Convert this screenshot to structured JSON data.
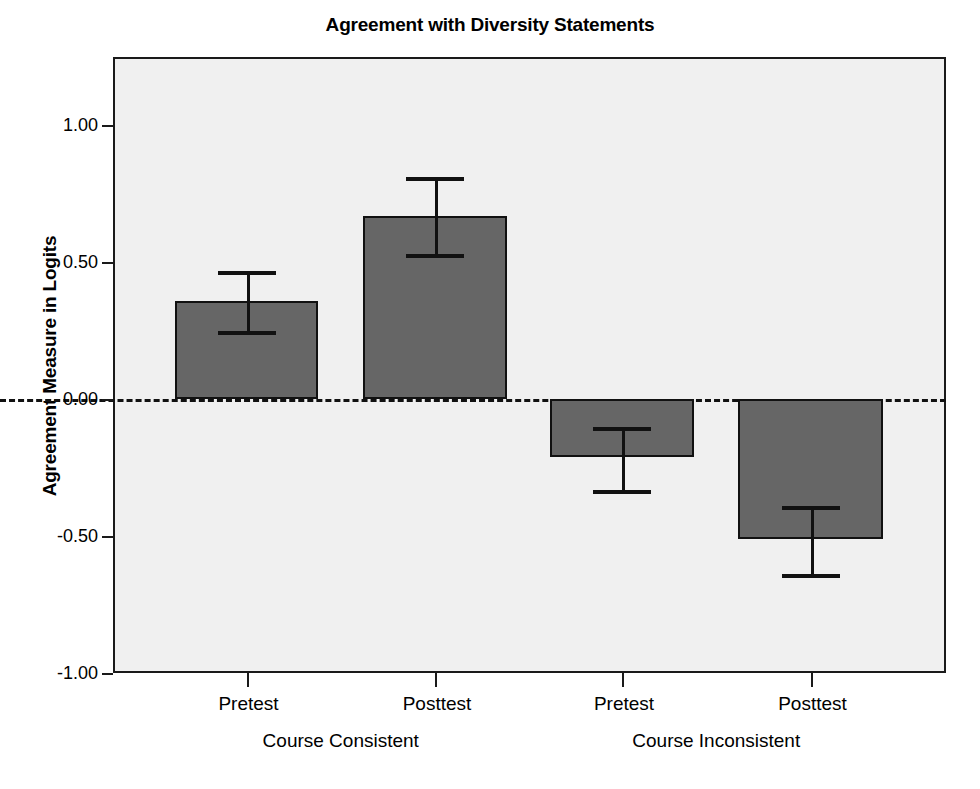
{
  "chart_data": {
    "type": "bar",
    "title": "Agreement with Diversity Statements",
    "xlabel": "",
    "ylabel": "Agreement Measure in Logits",
    "ylim": [
      -1.0,
      1.25
    ],
    "yticks": [
      1.0,
      0.5,
      0.0,
      -0.5,
      -1.0
    ],
    "ytick_labels": [
      "1.00",
      "0.50",
      "0.00",
      "-0.50",
      "-1.00"
    ],
    "grid": false,
    "legend": "none",
    "zero_reference_line": 0.0,
    "categories": [
      "Pretest",
      "Posttest",
      "Pretest",
      "Posttest"
    ],
    "groups": [
      {
        "label": "Course Consistent",
        "categories": [
          "Pretest",
          "Posttest"
        ]
      },
      {
        "label": "Course Inconsistent",
        "categories": [
          "Pretest",
          "Posttest"
        ]
      }
    ],
    "values": [
      0.36,
      0.67,
      -0.21,
      -0.51
    ],
    "error_low": [
      0.25,
      0.53,
      -0.33,
      -0.64
    ],
    "error_high": [
      0.47,
      0.81,
      -0.1,
      -0.39
    ],
    "bars": [
      {
        "group": "Course Consistent",
        "category": "Pretest",
        "value": 0.36,
        "ci_low": 0.25,
        "ci_high": 0.47
      },
      {
        "group": "Course Consistent",
        "category": "Posttest",
        "value": 0.67,
        "ci_low": 0.53,
        "ci_high": 0.81
      },
      {
        "group": "Course Inconsistent",
        "category": "Pretest",
        "value": -0.21,
        "ci_low": -0.33,
        "ci_high": -0.1
      },
      {
        "group": "Course Inconsistent",
        "category": "Posttest",
        "value": -0.51,
        "ci_low": -0.64,
        "ci_high": -0.39
      }
    ],
    "colors": {
      "bar_fill": "#666666",
      "bar_edge": "#111111",
      "plot_background": "#f0f0f0",
      "frame": "#1a1a1a",
      "error_bar": "#111111",
      "text": "#000000",
      "figure_background": "#ffffff"
    }
  },
  "axis": {
    "y_tick_labels": [
      "1.00",
      "0.50",
      "0.00",
      "-0.50",
      "-1.00"
    ],
    "x_tick_labels": [
      "Pretest",
      "Posttest",
      "Pretest",
      "Posttest"
    ],
    "group_labels": [
      "Course Consistent",
      "Course Inconsistent"
    ]
  }
}
